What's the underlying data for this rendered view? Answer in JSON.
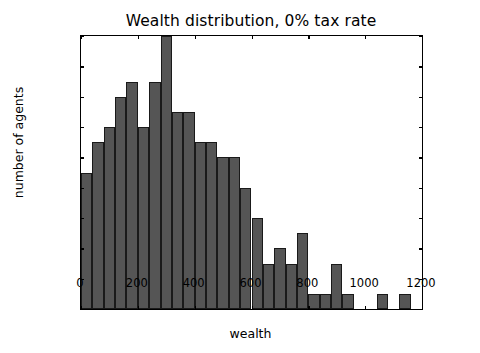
{
  "chart_data": {
    "type": "bar",
    "title": "Wealth distribution, 0% tax rate",
    "xlabel": "wealth",
    "ylabel": "number of agents",
    "grid": false,
    "legend": null,
    "xlim": [
      0,
      1200
    ],
    "ylim": [
      0,
      18
    ],
    "bin_width": 40,
    "xticks": [
      0,
      200,
      400,
      600,
      800,
      1000,
      1200
    ],
    "xtick_labels": [
      "0",
      "200",
      "400",
      "600",
      "800",
      "1000",
      "1200"
    ],
    "yticks": [
      0,
      2,
      4,
      6,
      8,
      10,
      12,
      14,
      16,
      18
    ],
    "ytick_labels": [
      "0",
      "2",
      "4",
      "6",
      "8",
      "10",
      "12",
      "14",
      "16",
      "18"
    ],
    "bar_color": "#555555",
    "bar_edge_color": "#1a1a1a",
    "bin_starts": [
      0,
      40,
      80,
      120,
      160,
      200,
      240,
      280,
      320,
      360,
      400,
      440,
      480,
      520,
      560,
      600,
      640,
      680,
      720,
      760,
      800,
      840,
      880,
      920,
      960,
      1000,
      1040,
      1080,
      1120,
      1160
    ],
    "categories": [
      "0-40",
      "40-80",
      "80-120",
      "120-160",
      "160-200",
      "200-240",
      "240-280",
      "280-320",
      "320-360",
      "360-400",
      "400-440",
      "440-480",
      "480-520",
      "520-560",
      "560-600",
      "600-640",
      "640-680",
      "680-720",
      "720-760",
      "760-800",
      "800-840",
      "840-880",
      "880-920",
      "920-960",
      "960-1000",
      "1000-1040",
      "1040-1080",
      "1080-1120",
      "1120-1160",
      "1160-1200"
    ],
    "values": [
      9,
      11,
      12,
      14,
      15,
      12,
      15,
      18,
      13,
      13,
      11,
      11,
      10,
      10,
      8,
      6,
      3,
      4,
      3,
      5,
      1,
      1,
      3,
      1,
      0,
      0,
      1,
      0,
      1,
      0
    ]
  }
}
